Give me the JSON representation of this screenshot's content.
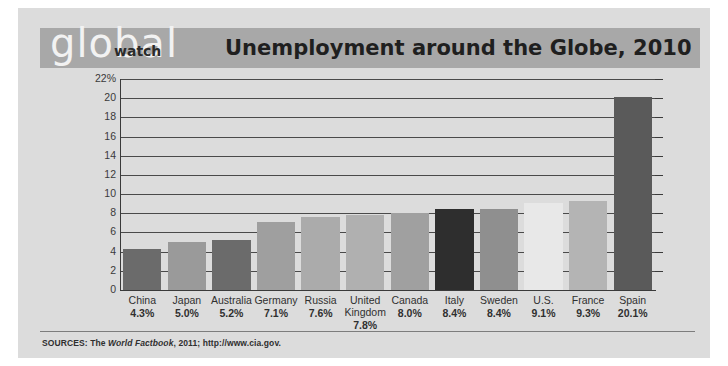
{
  "brand": {
    "logo_primary": "global",
    "logo_secondary": "watch"
  },
  "header": {
    "title": "Unemployment around the Globe, 2010",
    "band_color": "#a8a8a8"
  },
  "source": {
    "prefix": "SOURCES: The ",
    "italic": "World Factbook",
    "suffix": ", 2011; http://www.cia.gov."
  },
  "chart_data": {
    "type": "bar",
    "title": "Unemployment around the Globe, 2010",
    "xlabel": "",
    "ylabel": "",
    "ylim": [
      0,
      22
    ],
    "ytick_values": [
      22,
      20,
      18,
      16,
      14,
      12,
      10,
      8,
      6,
      4,
      2,
      0
    ],
    "ytick_labels": [
      "22%",
      "20",
      "18",
      "16",
      "14",
      "12",
      "10",
      "8",
      "6",
      "4",
      "2",
      "0"
    ],
    "grid": true,
    "legend": "none",
    "categories": [
      "China",
      "Japan",
      "Australia",
      "Germany",
      "Russia",
      "United Kingdom",
      "Canada",
      "Italy",
      "Sweden",
      "U.S.",
      "France",
      "Spain"
    ],
    "category_labels": [
      "China",
      "Japan",
      "Australia",
      "Germany",
      "Russia",
      "United Kingdom",
      "Canada",
      "Italy",
      "Sweden",
      "U.S.",
      "France",
      "Spain"
    ],
    "values": [
      4.3,
      5.0,
      5.2,
      7.1,
      7.6,
      7.8,
      8.0,
      8.4,
      8.4,
      9.1,
      9.3,
      20.1
    ],
    "value_labels": [
      "4.3%",
      "5.0%",
      "5.2%",
      "7.1%",
      "7.6%",
      "7.8%",
      "8.0%",
      "8.4%",
      "8.4%",
      "9.1%",
      "9.3%",
      "20.1%"
    ],
    "bar_colors": [
      "#6b6b6b",
      "#9a9a9a",
      "#6b6b6b",
      "#9f9f9f",
      "#ababab",
      "#b0b0b0",
      "#a0a0a0",
      "#2e2e2e",
      "#8f8f8f",
      "#e8e8e8",
      "#b4b4b4",
      "#5a5a5a"
    ]
  }
}
